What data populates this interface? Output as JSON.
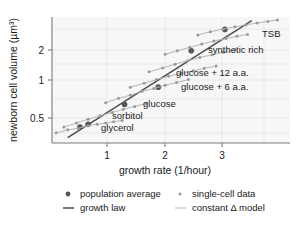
{
  "chart_data": {
    "type": "scatter",
    "title": "",
    "xlabel": "growth rate (1/hour)",
    "ylabel": "newborn cell volume (µm³)",
    "xscale": "log",
    "yscale": "log",
    "xlim": [
      0.6,
      4.0
    ],
    "ylim": [
      0.3,
      2.9
    ],
    "xticks": [
      "1",
      "2",
      "3"
    ],
    "xtick_values": [
      1,
      2,
      3
    ],
    "yticks": [
      "0.5",
      "1",
      "2"
    ],
    "ytick_values": [
      0.5,
      1,
      2
    ],
    "grid": true,
    "legend_position": "below-axes",
    "annotations": [
      "TSB",
      "synthetic rich",
      "glucose + 12 a.a.",
      "glucose + 6 a.a.",
      "glucose",
      "sorbitol",
      "glycerol"
    ],
    "series": [
      {
        "name": "growth law",
        "style": "dark-line",
        "x": [
          0.68,
          2.95
        ],
        "y": [
          0.33,
          2.72
        ]
      },
      {
        "name": "population average",
        "style": "dark-dot",
        "x": [
          0.75,
          0.8,
          1.07,
          1.4,
          1.82,
          2.38
        ],
        "y": [
          0.4,
          0.42,
          0.6,
          0.82,
          1.58,
          2.32
        ]
      },
      {
        "name": "glycerol",
        "style": "single-cell",
        "label": "glycerol",
        "x": [
          0.62,
          0.68,
          0.74,
          0.8,
          0.86,
          0.92,
          0.98,
          1.05
        ],
        "y": [
          0.36,
          0.38,
          0.39,
          0.41,
          0.42,
          0.43,
          0.44,
          0.45
        ]
      },
      {
        "name": "sorbitol",
        "style": "single-cell",
        "label": "sorbitol",
        "x": [
          0.66,
          0.73,
          0.8,
          0.88,
          0.97,
          1.06,
          1.16,
          1.27
        ],
        "y": [
          0.4,
          0.43,
          0.46,
          0.49,
          0.52,
          0.55,
          0.58,
          0.61
        ]
      },
      {
        "name": "glucose",
        "style": "single-cell",
        "label": "glucose",
        "x": [
          0.92,
          1.02,
          1.12,
          1.23,
          1.35,
          1.48,
          1.62,
          1.78
        ],
        "y": [
          0.62,
          0.67,
          0.71,
          0.76,
          0.8,
          0.85,
          0.89,
          0.94
        ]
      },
      {
        "name": "glucose + 6 a.a.",
        "style": "single-cell",
        "label": "glucose + 6 a.a.",
        "x": [
          1.12,
          1.25,
          1.38,
          1.52,
          1.68,
          1.85,
          2.02,
          2.22
        ],
        "y": [
          0.82,
          0.88,
          0.94,
          1.0,
          1.05,
          1.1,
          1.15,
          1.2
        ]
      },
      {
        "name": "glucose + 12 a.a.",
        "style": "single-cell",
        "label": "glucose + 12 a.a.",
        "x": [
          1.3,
          1.45,
          1.6,
          1.77,
          1.95,
          2.15,
          2.35,
          2.58
        ],
        "y": [
          1.08,
          1.16,
          1.24,
          1.32,
          1.4,
          1.47,
          1.54,
          1.6
        ]
      },
      {
        "name": "synthetic rich",
        "style": "single-cell",
        "label": "synthetic rich",
        "x": [
          1.48,
          1.63,
          1.8,
          1.98,
          2.18,
          2.4,
          2.62,
          2.85
        ],
        "y": [
          1.48,
          1.58,
          1.68,
          1.78,
          1.88,
          1.97,
          2.05,
          2.12
        ]
      },
      {
        "name": "TSB",
        "style": "single-cell",
        "label": "TSB",
        "x": [
          1.92,
          2.12,
          2.34,
          2.58,
          2.82,
          3.08,
          3.35,
          3.62
        ],
        "y": [
          2.1,
          2.22,
          2.33,
          2.43,
          2.52,
          2.6,
          2.68,
          2.75
        ]
      }
    ]
  },
  "legend": {
    "entries": [
      {
        "label": "population average",
        "marker": "dark-dot"
      },
      {
        "label": "single-cell data",
        "marker": "light-dot"
      },
      {
        "label": "growth law",
        "marker": "dark-line"
      },
      {
        "label": "constant Δ model",
        "marker": "light-line"
      }
    ]
  },
  "colors": {
    "plot_background": "#f7f7f7",
    "grid": "#e3e3e3",
    "axis": "#7a7a7a",
    "growth_law": "#4d4d4d",
    "constant_model": "#b5b5b5",
    "population_dot": "#555555",
    "single_cell_dot": "#9a9a9a",
    "text": "#1a1a1a"
  }
}
